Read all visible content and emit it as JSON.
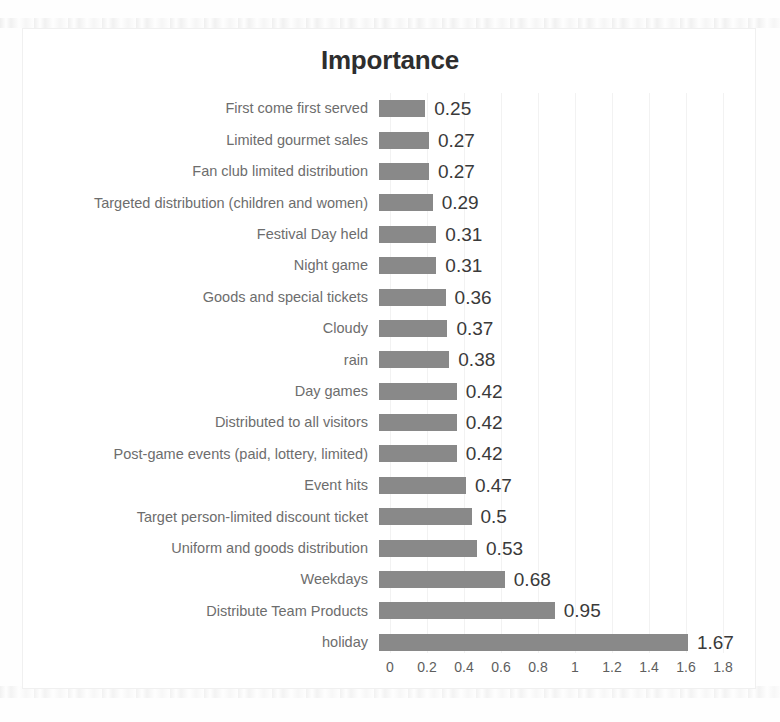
{
  "chart_data": {
    "type": "bar",
    "orientation": "horizontal",
    "title": "Importance",
    "xlabel": "",
    "ylabel": "",
    "xlim": [
      0,
      1.8
    ],
    "xticks": [
      "0",
      "0.2",
      "0.4",
      "0.6",
      "0.8",
      "1",
      "1.2",
      "1.4",
      "1.6",
      "1.8"
    ],
    "xtick_values": [
      0,
      0.2,
      0.4,
      0.6,
      0.8,
      1,
      1.2,
      1.4,
      1.6,
      1.8
    ],
    "grid": true,
    "legend": false,
    "bar_color": "#898989",
    "categories": [
      "First come first served",
      "Limited gourmet sales",
      "Fan club limited distribution",
      "Targeted distribution (children and women)",
      "Festival Day held",
      "Night game",
      "Goods and special tickets",
      "Cloudy",
      "rain",
      "Day games",
      "Distributed to all visitors",
      "Post-game events (paid, lottery, limited)",
      "Event hits",
      "Target person-limited discount ticket",
      "Uniform and goods distribution",
      "Weekdays",
      "Distribute Team Products",
      "holiday"
    ],
    "values": [
      0.25,
      0.27,
      0.27,
      0.29,
      0.31,
      0.31,
      0.36,
      0.37,
      0.38,
      0.42,
      0.42,
      0.42,
      0.47,
      0.5,
      0.53,
      0.68,
      0.95,
      1.67
    ],
    "value_labels": [
      "0.25",
      "0.27",
      "0.27",
      "0.29",
      "0.31",
      "0.31",
      "0.36",
      "0.37",
      "0.38",
      "0.42",
      "0.42",
      "0.42",
      "0.47",
      "0.5",
      "0.53",
      "0.68",
      "0.95",
      "1.67"
    ]
  }
}
